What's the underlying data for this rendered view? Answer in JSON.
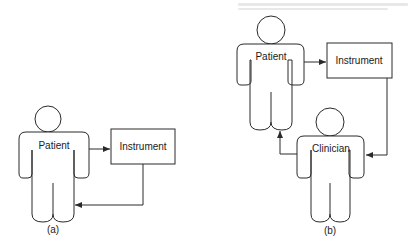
{
  "figure_a": {
    "caption": "(a)",
    "patient_label": "Patient",
    "instrument_label": "Instrument"
  },
  "figure_b": {
    "caption": "(b)",
    "patient_label": "Patient",
    "instrument_label": "Instrument",
    "clinician_label": "Clinician"
  },
  "colors": {
    "stroke": "#2a2a2a",
    "background": "#ffffff"
  }
}
